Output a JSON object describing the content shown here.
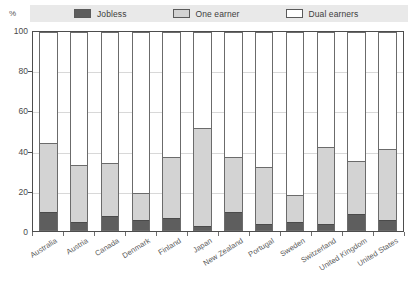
{
  "axis": {
    "unit_label": "%",
    "y_ticks": [
      0,
      20,
      40,
      60,
      80,
      100
    ],
    "ylabel": "",
    "xlabel": ""
  },
  "legend": {
    "entries": [
      {
        "label": "Jobless",
        "color": "#5e5e5e",
        "name": "legend-jobless"
      },
      {
        "label": "One earner",
        "color": "#d3d3d3",
        "name": "legend-one-earner"
      },
      {
        "label": "Dual earners",
        "color": "#ffffff",
        "name": "legend-dual-earners"
      }
    ]
  },
  "chart_data": {
    "type": "bar",
    "title": "",
    "subtitle": "",
    "xlabel": "",
    "ylabel": "%",
    "ylim": [
      0,
      100
    ],
    "grid": true,
    "stacked": true,
    "legend_position": "top",
    "categories": [
      "Australia",
      "Austria",
      "Canada",
      "Denmark",
      "Finland",
      "Japan",
      "New Zealand",
      "Portugal",
      "Sweden",
      "Switzerland",
      "United Kingdom",
      "United States"
    ],
    "series": [
      {
        "name": "Jobless",
        "color": "#5e5e5e",
        "values": [
          9,
          4,
          7,
          5,
          6,
          2,
          9,
          3,
          4,
          3,
          8,
          5
        ]
      },
      {
        "name": "One earner",
        "color": "#d3d3d3",
        "values": [
          35,
          29,
          27,
          14,
          31,
          50,
          28,
          29,
          14,
          39,
          27,
          36
        ]
      },
      {
        "name": "Dual earners",
        "color": "#ffffff",
        "values": [
          56,
          67,
          66,
          81,
          63,
          48,
          63,
          68,
          82,
          58,
          65,
          59
        ]
      }
    ],
    "cumulative_tops": {
      "jobless": [
        9,
        4,
        7,
        5,
        6,
        2,
        9,
        3,
        4,
        3,
        8,
        5
      ],
      "one_earner": [
        44,
        33,
        34,
        19,
        37,
        52,
        37,
        32,
        18,
        42,
        35,
        41
      ],
      "total": [
        100,
        100,
        100,
        100,
        100,
        100,
        100,
        100,
        100,
        100,
        100,
        100
      ]
    }
  }
}
